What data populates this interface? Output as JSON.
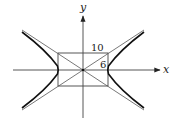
{
  "diagram": {
    "type": "hyperbola-with-asymptotes",
    "axes": {
      "x_label": "x",
      "y_label": "y"
    },
    "rectangle": {
      "width_label": "10",
      "height_label": "6"
    },
    "colors": {
      "stroke": "#333333",
      "curve": "#111111",
      "background": "#ffffff"
    }
  }
}
